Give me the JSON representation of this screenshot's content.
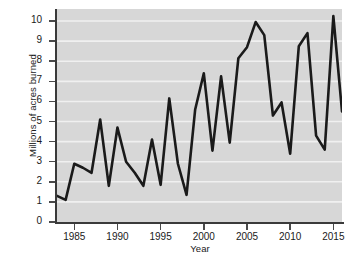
{
  "chart_data": {
    "type": "line",
    "title": "",
    "subtitle": "",
    "xlabel": "Year",
    "ylabel": "Millions of acres burned",
    "xlim": [
      1983,
      2016
    ],
    "ylim": [
      0,
      10.6
    ],
    "grid": "horizontal-white",
    "legend": "none",
    "xticks": [
      1985,
      1990,
      1995,
      2000,
      2005,
      2010,
      2015
    ],
    "yticks": [
      0,
      1,
      2,
      3,
      4,
      5,
      6,
      7,
      8,
      9,
      10
    ],
    "x": [
      1983,
      1984,
      1985,
      1986,
      1987,
      1988,
      1989,
      1990,
      1991,
      1992,
      1993,
      1994,
      1995,
      1996,
      1997,
      1998,
      1999,
      2000,
      2001,
      2002,
      2003,
      2004,
      2005,
      2006,
      2007,
      2008,
      2009,
      2010,
      2011,
      2012,
      2013,
      2014,
      2015,
      2016
    ],
    "values": [
      1.3,
      1.1,
      2.9,
      2.7,
      2.45,
      5.1,
      1.8,
      4.7,
      3.0,
      2.45,
      1.8,
      4.1,
      1.85,
      6.15,
      2.9,
      1.35,
      5.6,
      7.4,
      3.55,
      7.25,
      3.95,
      8.15,
      8.7,
      9.95,
      9.3,
      5.3,
      5.95,
      3.4,
      8.75,
      9.4,
      4.3,
      3.6,
      10.25,
      5.5
    ],
    "series_name": "Acres burned",
    "line_color": "#1a1a1a",
    "plot_background": "#d7d7d7",
    "gridline_color": "#f0f0f0",
    "axis_color": "#3a3a3a",
    "text_color": "#1a1a1a"
  }
}
